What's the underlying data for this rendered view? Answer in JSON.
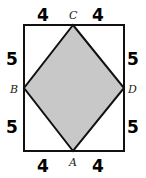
{
  "diagram": {
    "shape": "rhombus inscribed in rectangle",
    "fill_color": "#c8c8c8",
    "stroke_color": "#111111",
    "points": {
      "A": "A",
      "B": "B",
      "C": "C",
      "D": "D"
    },
    "measurements": {
      "top_left": "4",
      "top_right": "4",
      "bottom_left": "4",
      "bottom_right": "4",
      "left_upper": "5",
      "left_lower": "5",
      "right_upper": "5",
      "right_lower": "5"
    }
  }
}
